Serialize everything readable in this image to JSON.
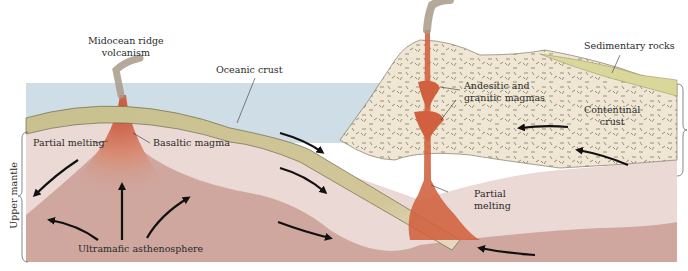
{
  "diagram": {
    "labels": {
      "midocean_ridge_line1": "Midocean ridge",
      "midocean_ridge_line2": "volcanism",
      "oceanic_crust": "Oceanic crust",
      "partial_melting_left": "Partial melting",
      "basaltic_magma": "Basaltic magma",
      "ultramafic": "Ultramafic asthenosphere",
      "upper_mantle": "Upper mantle",
      "andesitic_line1": "Andesitic and",
      "andesitic_line2": "granitic magmas",
      "sedimentary": "Sedimentary rocks",
      "continental_line1": "Contentinal",
      "continental_line2": "crust",
      "lithosphere": "Lithosphere",
      "partial_melting_right_line1": "Partial",
      "partial_melting_right_line2": "melting"
    },
    "colors": {
      "ocean": "#cfdde6",
      "oceanic_crust": "#c8c08e",
      "lithosphere_mantle": "#ead9d5",
      "asthenosphere": "#cfa79f",
      "magma": "#d0603e",
      "continental_crust": "#efe6d3",
      "sediment": "#d9d89a",
      "smoke": "#a89a88",
      "arrow": "#111111"
    }
  }
}
